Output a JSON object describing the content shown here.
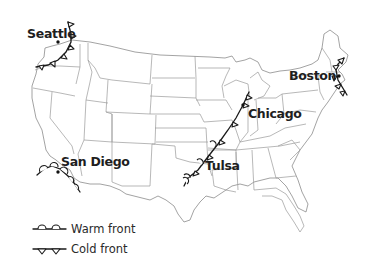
{
  "map": {
    "title": "United States weather fronts",
    "region": "Contiguous United States"
  },
  "cities": [
    {
      "name": "Seattle",
      "front": "cold"
    },
    {
      "name": "San Diego",
      "front": "warm"
    },
    {
      "name": "Chicago",
      "front": "cold"
    },
    {
      "name": "Tulsa",
      "front": "warm and cold"
    },
    {
      "name": "Boston",
      "front": "cold"
    }
  ],
  "legend": {
    "items": [
      {
        "label": "Warm front",
        "symbol": "semicircles"
      },
      {
        "label": "Cold front",
        "symbol": "triangles"
      }
    ]
  },
  "colors": {
    "front": "#1a1a1a",
    "borders": "#9a9a9a",
    "text": "#1e1e1e",
    "background": "#ffffff"
  }
}
